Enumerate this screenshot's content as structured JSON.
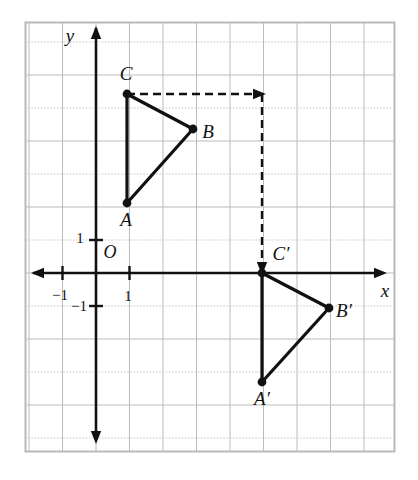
{
  "figure": {
    "background_color": "#ffffff",
    "frame": {
      "x": 25,
      "y": 22,
      "width": 370,
      "height": 430,
      "stroke": "#b9b9b9"
    },
    "grid": {
      "spacing_x": 33.5,
      "spacing_y": 33.0,
      "minor_color": "#bcbcbc",
      "dotted_color": "#c9c9c9",
      "visible": true
    },
    "axes": {
      "origin_px": {
        "x": 96,
        "y": 273
      },
      "x_axis_label": "x",
      "y_axis_label": "y",
      "origin_label": "O",
      "stroke": "#111111",
      "tick_labels": {
        "y_positive_one": "1",
        "y_negative_one": "−1",
        "x_positive_one": "1",
        "x_negative_one": "−1"
      }
    },
    "triangles": [
      {
        "name": "ABC",
        "stroke": "#111111",
        "vertices": [
          {
            "label": "A",
            "px": {
              "x": 127,
              "y": 203
            },
            "coord": {
              "x": 1,
              "y": 2
            },
            "label_px": {
              "x": 126,
              "y": 222
            }
          },
          {
            "label": "B",
            "px": {
              "x": 193,
              "y": 129
            },
            "coord": {
              "x": 3,
              "y": 4.4
            },
            "label_px": {
              "x": 208,
              "y": 134
            }
          },
          {
            "label": "C",
            "px": {
              "x": 127,
              "y": 94
            },
            "coord": {
              "x": 1,
              "y": 5.4
            },
            "label_px": {
              "x": 126,
              "y": 76
            }
          }
        ]
      },
      {
        "name": "A'B'C'",
        "stroke": "#111111",
        "vertices": [
          {
            "label": "A′",
            "px": {
              "x": 262,
              "y": 382
            },
            "coord": {
              "x": 5,
              "y": -3.3
            },
            "label_px": {
              "x": 262,
              "y": 401
            }
          },
          {
            "label": "B′",
            "px": {
              "x": 329,
              "y": 308
            },
            "coord": {
              "x": 7,
              "y": -1
            },
            "label_px": {
              "x": 344,
              "y": 313
            }
          },
          {
            "label": "C′",
            "px": {
              "x": 262,
              "y": 273
            },
            "coord": {
              "x": 5,
              "y": 0
            },
            "label_px": {
              "x": 281,
              "y": 256
            }
          }
        ]
      }
    ],
    "translation_arrows": [
      {
        "name": "horizontal-translation-arrow",
        "from_px": {
          "x": 127,
          "y": 94
        },
        "to_px": {
          "x": 258,
          "y": 94
        },
        "style": "dashed",
        "stroke": "#111111"
      },
      {
        "name": "vertical-translation-arrow",
        "from_px": {
          "x": 262,
          "y": 94
        },
        "to_px": {
          "x": 262,
          "y": 268
        },
        "style": "dashed",
        "stroke": "#111111"
      }
    ]
  }
}
